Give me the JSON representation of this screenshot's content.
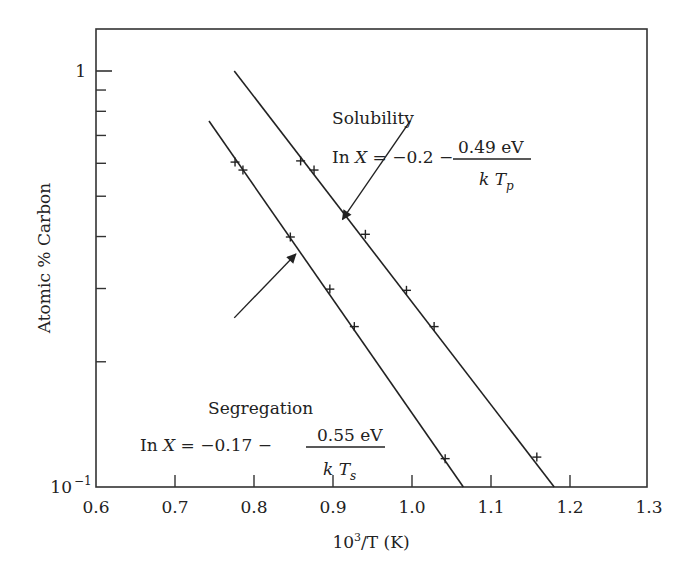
{
  "chart_data": {
    "type": "line",
    "title": "",
    "xlabel": "10^3/T (K)",
    "xlabel_parts": {
      "base": "10",
      "sup": "3",
      "rest": "/T (K)"
    },
    "ylabel": "Atomic % Carbon",
    "xlim": [
      0.6,
      1.3
    ],
    "ylim": [
      0.1,
      1.3
    ],
    "yscale": "log",
    "grid": false,
    "legend": "none",
    "x_ticks": [
      0.6,
      0.7,
      0.8,
      0.9,
      1.0,
      1.1,
      1.2,
      1.3
    ],
    "x_tick_labels": [
      "0.6",
      "0.7",
      "0.8",
      "0.9",
      "1.0",
      "1.1",
      "1.2",
      "1.3"
    ],
    "y_major_ticks": [
      {
        "value": 1,
        "label": "1"
      },
      {
        "value": 0.1,
        "label": "10",
        "sup": "−1"
      }
    ],
    "y_minor_ticks": [
      0.9,
      0.8,
      0.7,
      0.6,
      0.5,
      0.4,
      0.3,
      0.2
    ],
    "series": [
      {
        "name": "Solubility",
        "equation": "ln X = −0.2 − 0.49 eV / k T_p",
        "line": {
          "x": [
            0.775,
            1.18
          ],
          "y": [
            1.0,
            0.1
          ]
        },
        "points": [
          {
            "x": 0.859,
            "y": 0.608
          },
          {
            "x": 0.876,
            "y": 0.578
          },
          {
            "x": 0.941,
            "y": 0.405
          },
          {
            "x": 0.993,
            "y": 0.297
          },
          {
            "x": 1.028,
            "y": 0.243
          },
          {
            "x": 1.158,
            "y": 0.118
          }
        ]
      },
      {
        "name": "Segregation",
        "equation": "ln X = −0.17 − 0.55 eV / k T_s",
        "line": {
          "x": [
            0.743,
            1.065
          ],
          "y": [
            0.758,
            0.1
          ]
        },
        "points": [
          {
            "x": 0.776,
            "y": 0.604
          },
          {
            "x": 0.786,
            "y": 0.578
          },
          {
            "x": 0.846,
            "y": 0.399
          },
          {
            "x": 0.896,
            "y": 0.299
          },
          {
            "x": 0.927,
            "y": 0.243
          },
          {
            "x": 1.042,
            "y": 0.117
          }
        ]
      }
    ],
    "annotations": [
      {
        "id": "solubility",
        "title": "Solubility",
        "lhs": "In",
        "var": "X",
        "eq": " = −0.2 − ",
        "numerator": "0.49 eV",
        "den_k": "k",
        "den_T": "T",
        "den_sub": "p",
        "arrow_from": {
          "x": 0.998,
          "y": 0.76
        },
        "arrow_to": {
          "x": 0.912,
          "y": 0.44
        }
      },
      {
        "id": "segregation",
        "title": "Segregation",
        "lhs": "In",
        "var": "X",
        "eq": " = −0.17 − ",
        "numerator": "0.55 eV",
        "den_k": "k",
        "den_T": "T",
        "den_sub": "s",
        "arrow_from": {
          "x": 0.775,
          "y": 0.255
        },
        "arrow_to": {
          "x": 0.853,
          "y": 0.363
        }
      }
    ]
  }
}
